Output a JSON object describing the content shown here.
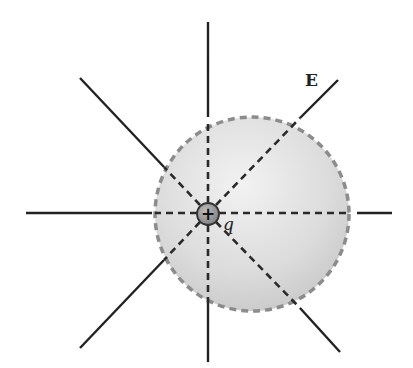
{
  "diagram": {
    "labels": {
      "field": "E",
      "charge": "q",
      "charge_sign": "+"
    },
    "colors": {
      "line": "#222222",
      "sphere_fill": "#d9d9d9",
      "sphere_edge": "#8c8c8c",
      "charge_fill": "#9a9a9a",
      "background": "#ffffff"
    },
    "elements": {
      "charge": {
        "cx": 208,
        "cy": 214,
        "r": 11
      },
      "gaussian_surface": {
        "cx": 252,
        "cy": 214,
        "r": 97,
        "style": "dashed"
      },
      "field_lines": [
        {
          "name": "up",
          "direction": "outward"
        },
        {
          "name": "down",
          "direction": "outward"
        },
        {
          "name": "left",
          "direction": "outward"
        },
        {
          "name": "right",
          "direction": "outward"
        },
        {
          "name": "upper-left",
          "direction": "outward"
        },
        {
          "name": "upper-right",
          "direction": "outward"
        },
        {
          "name": "lower-left",
          "direction": "outward"
        },
        {
          "name": "lower-right",
          "direction": "outward"
        }
      ]
    }
  }
}
